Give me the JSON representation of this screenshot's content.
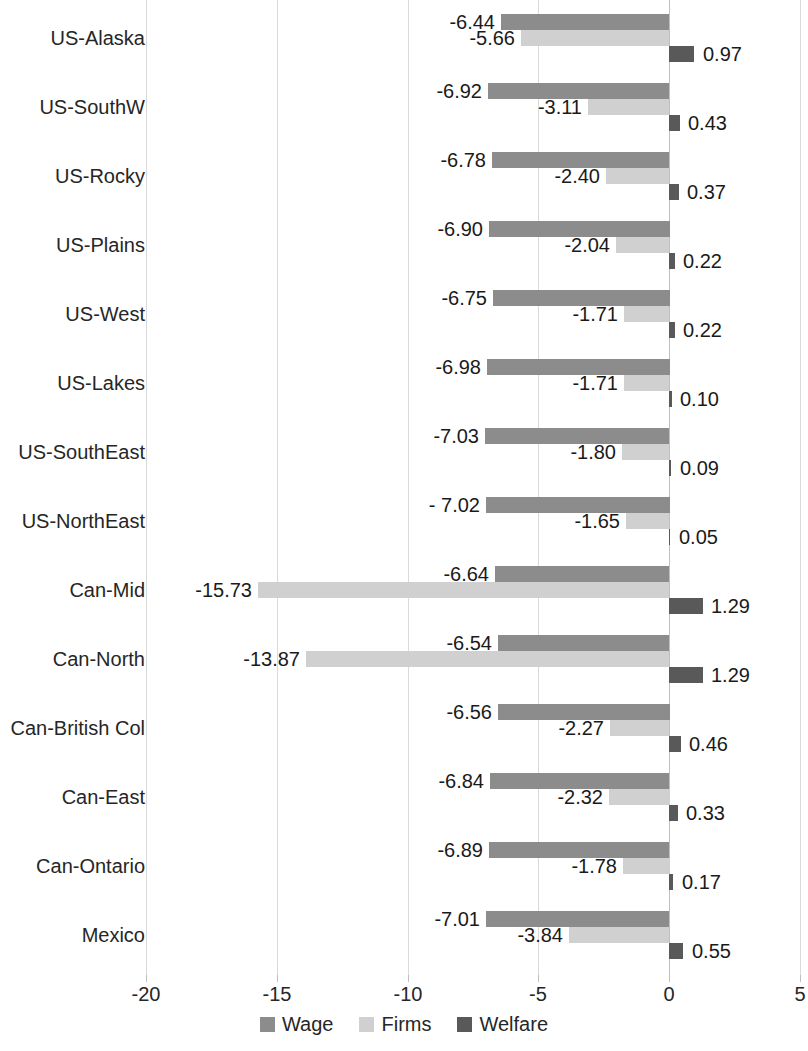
{
  "chart_data": {
    "type": "bar",
    "orientation": "horizontal",
    "grouped": true,
    "title": "",
    "subtitle": "",
    "xlabel": "",
    "ylabel": "",
    "xlim": [
      -20,
      5
    ],
    "xticks": [
      "-20",
      "-15",
      "-10",
      "-5",
      "0",
      "5"
    ],
    "xtick_values": [
      -20,
      -15,
      -10,
      -5,
      0,
      5
    ],
    "grid": true,
    "grid_axis": "x",
    "legend_position": "bottom",
    "categories": [
      "US-Alaska",
      "US-SouthW",
      "US-Rocky",
      "US-Plains",
      "US-West",
      "US-Lakes",
      "US-SouthEast",
      "US-NorthEast",
      "Can-Mid",
      "Can-North",
      "Can-British Col",
      "Can-East",
      "Can-Ontario",
      "Mexico"
    ],
    "series": [
      {
        "name": "Wage",
        "color": "#8c8c8c",
        "values": [
          -6.44,
          -6.92,
          -6.78,
          -6.9,
          -6.75,
          -6.98,
          -7.03,
          -7.02,
          -6.64,
          -6.54,
          -6.56,
          -6.84,
          -6.89,
          -7.01
        ],
        "labels": [
          "-6.44",
          "-6.92",
          "-6.78",
          "-6.90",
          "-6.75",
          "-6.98",
          "-7.03",
          "- 7.02",
          "-6.64",
          "-6.54",
          "-6.56",
          "-6.84",
          "-6.89",
          "-7.01"
        ]
      },
      {
        "name": "Firms",
        "color": "#d0d0d0",
        "values": [
          -5.66,
          -3.11,
          -2.4,
          -2.04,
          -1.71,
          -1.71,
          -1.8,
          -1.65,
          -15.73,
          -13.87,
          -2.27,
          -2.32,
          -1.78,
          -3.84
        ],
        "labels": [
          "-5.66",
          "-3.11",
          "-2.40",
          "-2.04",
          "-1.71",
          "-1.71",
          "-1.80",
          "-1.65",
          "-15.73",
          "-13.87",
          "-2.27",
          "-2.32",
          "-1.78",
          "-3.84"
        ]
      },
      {
        "name": "Welfare",
        "color": "#595959",
        "values": [
          0.97,
          0.43,
          0.37,
          0.22,
          0.22,
          0.1,
          0.09,
          0.05,
          1.29,
          1.29,
          0.46,
          0.33,
          0.17,
          0.55
        ],
        "labels": [
          "0.97",
          "0.43",
          "0.37",
          "0.22",
          "0.22",
          "0.10",
          "0.09",
          "0.05",
          "1.29",
          "1.29",
          "0.46",
          "0.33",
          "0.17",
          "0.55"
        ]
      }
    ],
    "legend": [
      {
        "label": "Wage",
        "color": "#8c8c8c"
      },
      {
        "label": "Firms",
        "color": "#d0d0d0"
      },
      {
        "label": "Welfare",
        "color": "#595959"
      }
    ]
  }
}
